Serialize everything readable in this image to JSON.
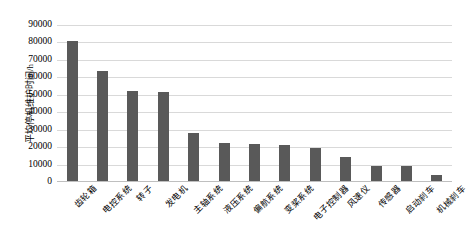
{
  "chart_data": {
    "type": "bar",
    "title": "",
    "subtitle": "",
    "xlabel": "",
    "ylabel": "平均停机维护时间/h",
    "ylim": [
      0,
      90000
    ],
    "ytick_labels": [
      "90000",
      "80000",
      "70000",
      "60000",
      "50000",
      "40000",
      "30000",
      "20000",
      "10000",
      "0"
    ],
    "ytick_values": [
      90000,
      80000,
      70000,
      60000,
      50000,
      40000,
      30000,
      20000,
      10000,
      0
    ],
    "grid": true,
    "legend": false,
    "legend_position": "none",
    "bar_color": "#595959",
    "gridline_color": "#D9D9D9",
    "categories": [
      "齿轮箱",
      "电控系统",
      "转子",
      "发电机",
      "主轴系统",
      "液压系统",
      "偏航系统",
      "变桨系统",
      "电子控制器",
      "风速仪",
      "传感器",
      "启动刹车",
      "机械刹车"
    ],
    "values": [
      80000,
      63000,
      51500,
      51200,
      27500,
      22000,
      21000,
      20500,
      19000,
      14000,
      8500,
      8500,
      3500
    ]
  }
}
